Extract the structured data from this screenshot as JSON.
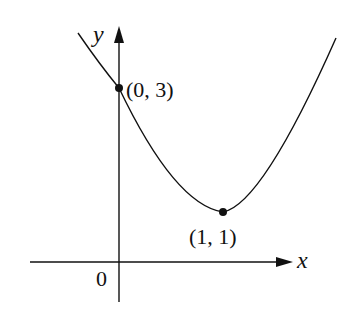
{
  "chart_data": {
    "type": "line",
    "title": "",
    "function": "y = 2(x - 1)^2 + 1",
    "xlabel": "x",
    "ylabel": "y",
    "origin_label": "0",
    "curve_shape": "upward parabola",
    "points": [
      {
        "x": 0,
        "y": 3,
        "label": "(0, 3)"
      },
      {
        "x": 1,
        "y": 1,
        "label": "(1, 1)"
      }
    ],
    "vertex": {
      "x": 1,
      "y": 1
    },
    "y_intercept": {
      "x": 0,
      "y": 3
    },
    "grid": false
  },
  "colors": {
    "ink": "#111111",
    "background": "#ffffff"
  }
}
